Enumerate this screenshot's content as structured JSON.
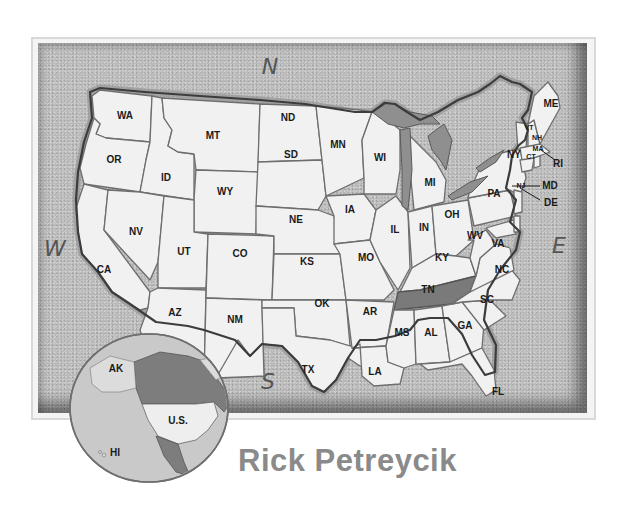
{
  "map": {
    "title": "United States",
    "highlighted_state": "TN",
    "colors": {
      "state_fill": "#f1f1f1",
      "highlight_fill": "#7a7a7a",
      "background": "#b9b9b9",
      "lakes": "#8f8f8f"
    },
    "compass": {
      "north": "N",
      "south": "S",
      "east": "E",
      "west": "W"
    },
    "states": {
      "WA": "WA",
      "OR": "OR",
      "CA": "CA",
      "ID": "ID",
      "NV": "NV",
      "MT": "MT",
      "WY": "WY",
      "UT": "UT",
      "AZ": "AZ",
      "CO": "CO",
      "NM": "NM",
      "ND": "ND",
      "SD": "SD",
      "NE": "NE",
      "KS": "KS",
      "OK": "OK",
      "TX": "TX",
      "MN": "MN",
      "IA": "IA",
      "MO": "MO",
      "AR": "AR",
      "LA": "LA",
      "WI": "WI",
      "IL": "IL",
      "MI": "MI",
      "IN": "IN",
      "OH": "OH",
      "KY": "KY",
      "TN": "TN",
      "MS": "MS",
      "AL": "AL",
      "GA": "GA",
      "FL": "FL",
      "SC": "SC",
      "NC": "NC",
      "VA": "VA",
      "WV": "WV",
      "PA": "PA",
      "NY": "NY",
      "VT": "VT",
      "NH": "NH",
      "ME": "ME",
      "MA": "MA",
      "CT": "CT",
      "RI": "RI",
      "NJ": "NJ",
      "MD": "MD",
      "DE": "DE"
    }
  },
  "inset": {
    "labels": {
      "alaska": "AK",
      "us": "U.S.",
      "hawaii": "HI"
    }
  },
  "credit": {
    "author": "Rick Petreycik"
  }
}
